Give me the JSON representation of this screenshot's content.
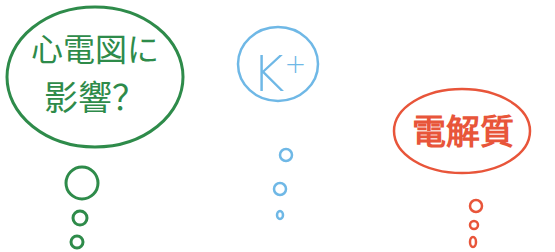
{
  "bubbles": [
    {
      "id": "ecg",
      "text_line1": "心電図に",
      "text_line2": "影響？",
      "color": "#2e8b4a"
    },
    {
      "id": "potassium",
      "text": "K",
      "superscript": "+",
      "color": "#6fb8e6"
    },
    {
      "id": "electrolyte",
      "text": "電解質",
      "color": "#e8553a"
    }
  ]
}
